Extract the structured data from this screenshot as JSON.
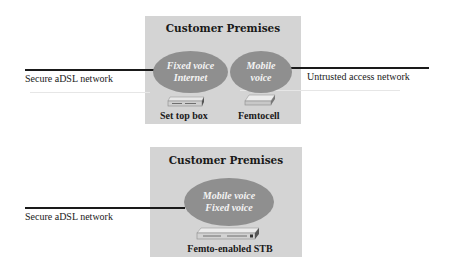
{
  "top_diagram": {
    "premises_title": "Customer Premises",
    "left_network_label": "Secure aDSL network",
    "right_network_label": "Untrusted access network",
    "ellipses": [
      {
        "lines": [
          "Fixed voice",
          "Internet"
        ]
      },
      {
        "lines": [
          "Mobile",
          "voice"
        ]
      }
    ],
    "devices": [
      {
        "label": "Set top box",
        "icon": "set-top-box-icon"
      },
      {
        "label": "Femtocell",
        "icon": "femtocell-icon"
      }
    ]
  },
  "bottom_diagram": {
    "premises_title": "Customer Premises",
    "left_network_label": "Secure aDSL network",
    "ellipses": [
      {
        "lines": [
          "Mobile voice",
          "Fixed voice"
        ]
      }
    ],
    "devices": [
      {
        "label": "Femto-enabled STB",
        "icon": "femto-enabled-stb-icon"
      }
    ]
  },
  "colors": {
    "premises_background": "#d4d4d4",
    "ellipse_fill": "#8f8f8f",
    "ellipse_text": "#f4f4f4",
    "line": "#1a1a1a"
  }
}
